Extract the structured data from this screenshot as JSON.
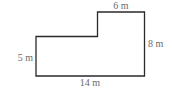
{
  "figure": {
    "shape": "L-shaped polygon",
    "stroke_color": "#2a2a2a",
    "label_color": "#6b6b6b",
    "points": [
      [
        36,
        36.5
      ],
      [
        97.5,
        36.5
      ],
      [
        97.5,
        12
      ],
      [
        144.5,
        12
      ],
      [
        144.5,
        76
      ],
      [
        36,
        76
      ]
    ],
    "labels": {
      "top": "6 m",
      "right": "8 m",
      "left": "5 m",
      "bottom": "14 m"
    }
  }
}
